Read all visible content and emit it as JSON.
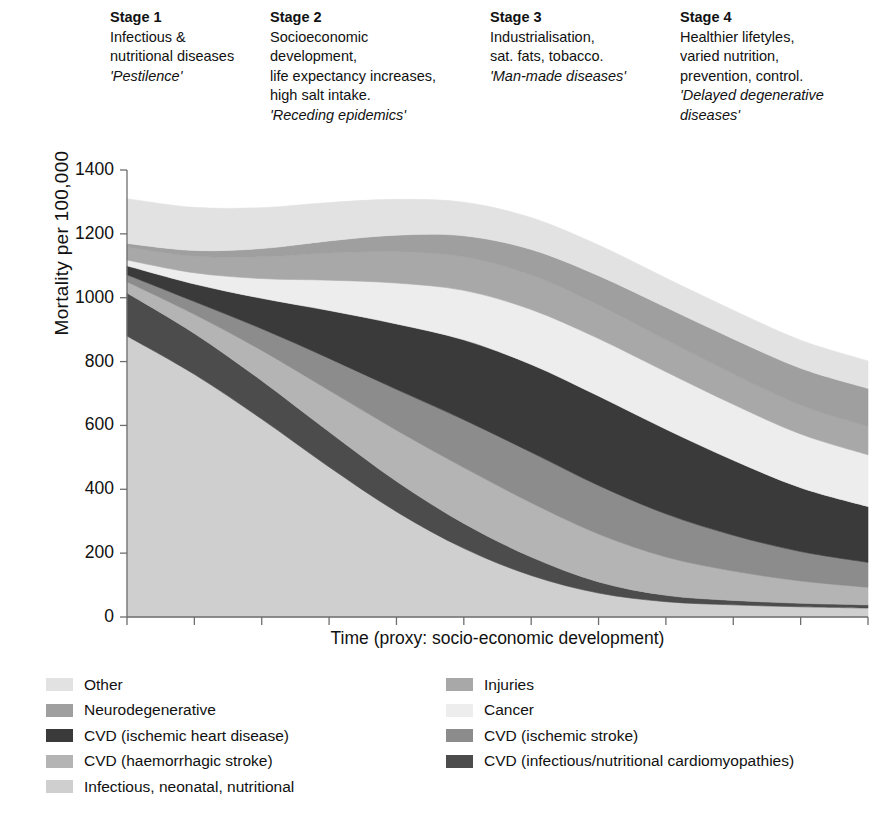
{
  "stages": [
    {
      "id": "stage-1",
      "heading": "Stage 1",
      "lines": [
        "Infectious &",
        "nutritional diseases"
      ],
      "quote": "'Pestilence'"
    },
    {
      "id": "stage-2",
      "heading": "Stage 2",
      "lines": [
        "Socioeconomic",
        "development,",
        "life expectancy increases,",
        "high salt intake."
      ],
      "quote": "'Receding epidemics'"
    },
    {
      "id": "stage-3",
      "heading": "Stage 3",
      "lines": [
        "Industrialisation,",
        "sat. fats, tobacco."
      ],
      "quote": "'Man-made diseases'"
    },
    {
      "id": "stage-4",
      "heading": "Stage 4",
      "lines": [
        "Healthier lifetyles,",
        "varied nutrition,",
        "prevention, control."
      ],
      "quote": "'Delayed degenerative diseases'"
    }
  ],
  "axes": {
    "ylabel": "Mortality  per 100,000",
    "xlabel": "Time (proxy: socio-economic development)",
    "yticks": [
      "1400",
      "1200",
      "1000",
      "800",
      "600",
      "400",
      "200",
      "0"
    ]
  },
  "legend": {
    "left": [
      {
        "label": "Other",
        "color": "#e2e2e2"
      },
      {
        "label": "Neurodegenerative",
        "color": "#9f9f9f"
      },
      {
        "label": "CVD (ischemic heart disease)",
        "color": "#3a3a3a"
      },
      {
        "label": "CVD (haemorrhagic stroke)",
        "color": "#b4b4b4"
      },
      {
        "label": "Infectious, neonatal, nutritional",
        "color": "#cfcfcf"
      }
    ],
    "right": [
      {
        "label": "Injuries",
        "color": "#a8a8a8"
      },
      {
        "label": "Cancer",
        "color": "#ededed"
      },
      {
        "label": "CVD (ischemic stroke)",
        "color": "#8c8c8c"
      },
      {
        "label": "CVD (infectious/nutritional cardiomyopathies)",
        "color": "#4c4c4c"
      }
    ]
  },
  "chart_data": {
    "type": "area",
    "title": "",
    "xlabel": "Time (proxy: socio-economic development)",
    "ylabel": "Mortality per 100,000",
    "ylim": [
      0,
      1400
    ],
    "xlim": [
      0,
      11
    ],
    "grid": false,
    "legend_position": "bottom",
    "stacked": true,
    "x": [
      0,
      1,
      2,
      3,
      4,
      5,
      6,
      7,
      8,
      9,
      10,
      11
    ],
    "stack_order_bottom_to_top": [
      "Infectious, neonatal, nutritional",
      "CVD (infectious/nutritional cardiomyopathies)",
      "CVD (haemorrhagic stroke)",
      "CVD (ischemic stroke)",
      "CVD (ischemic heart disease)",
      "Cancer",
      "Injuries",
      "Neurodegenerative",
      "Other"
    ],
    "series": [
      {
        "name": "Infectious, neonatal, nutritional",
        "color": "#cfcfcf",
        "values": [
          880,
          760,
          620,
          470,
          330,
          215,
          130,
          75,
          48,
          38,
          32,
          28
        ]
      },
      {
        "name": "CVD (infectious/nutritional cardiomyopathies)",
        "color": "#4c4c4c",
        "values": [
          135,
          128,
          120,
          110,
          95,
          78,
          58,
          35,
          20,
          14,
          11,
          10
        ]
      },
      {
        "name": "CVD (haemorrhagic stroke)",
        "color": "#b4b4b4",
        "values": [
          35,
          60,
          95,
          130,
          160,
          175,
          170,
          150,
          120,
          92,
          70,
          55
        ]
      },
      {
        "name": "CVD (ischemic stroke)",
        "color": "#8c8c8c",
        "values": [
          22,
          40,
          68,
          100,
          128,
          150,
          158,
          152,
          135,
          112,
          92,
          78
        ]
      },
      {
        "name": "CVD (ischemic heart disease)",
        "color": "#3a3a3a",
        "values": [
          28,
          55,
          95,
          150,
          205,
          250,
          275,
          280,
          265,
          235,
          200,
          175
        ]
      },
      {
        "name": "Cancer",
        "color": "#ededed",
        "values": [
          18,
          35,
          62,
          95,
          128,
          155,
          172,
          180,
          180,
          175,
          168,
          162
        ]
      },
      {
        "name": "Injuries",
        "color": "#a8a8a8",
        "values": [
          40,
          52,
          68,
          85,
          98,
          105,
          108,
          105,
          100,
          95,
          90,
          88
        ]
      },
      {
        "name": "Neurodegenerative",
        "color": "#9f9f9f",
        "values": [
          12,
          18,
          26,
          38,
          52,
          66,
          80,
          92,
          102,
          110,
          116,
          120
        ]
      },
      {
        "name": "Other",
        "color": "#e2e2e2",
        "values": [
          140,
          135,
          128,
          120,
          112,
          105,
          100,
          96,
          92,
          90,
          88,
          86
        ]
      }
    ],
    "totals": [
      1310,
      1283,
      1282,
      1298,
      1308,
      1299,
      1251,
      1165,
      1062,
      961,
      867,
      802
    ]
  }
}
